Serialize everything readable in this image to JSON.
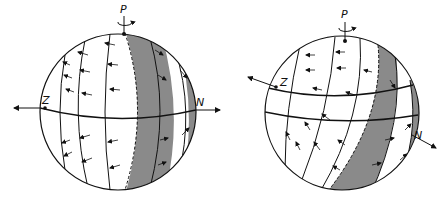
{
  "figure": {
    "left_sphere": {
      "pole_label": "P",
      "axis_label_left": "Z",
      "axis_label_right": "N"
    },
    "right_sphere": {
      "pole_label": "P",
      "axis_label_left": "Z",
      "axis_label_right": "N"
    },
    "colors": {
      "line": "#111111",
      "shaded_band": "#8a8a8a",
      "background": "#ffffff"
    }
  }
}
